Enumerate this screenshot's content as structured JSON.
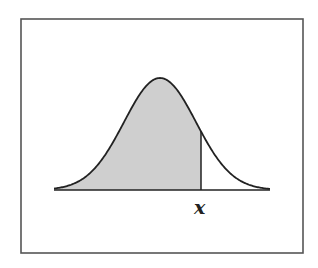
{
  "figure": {
    "label": "x",
    "colors": {
      "frame": "#555555",
      "curve": "#222222",
      "shade": "#cfcfcf",
      "background": "#ffffff"
    },
    "frame": {
      "x": 21,
      "y": 19,
      "width": 282,
      "height": 234
    },
    "curve": {
      "mean_x": 160,
      "sigma_px": 36,
      "peak_y": 78,
      "baseline_y": 190,
      "x_start": 54,
      "x_end": 270
    },
    "cutoff_x": 201
  }
}
